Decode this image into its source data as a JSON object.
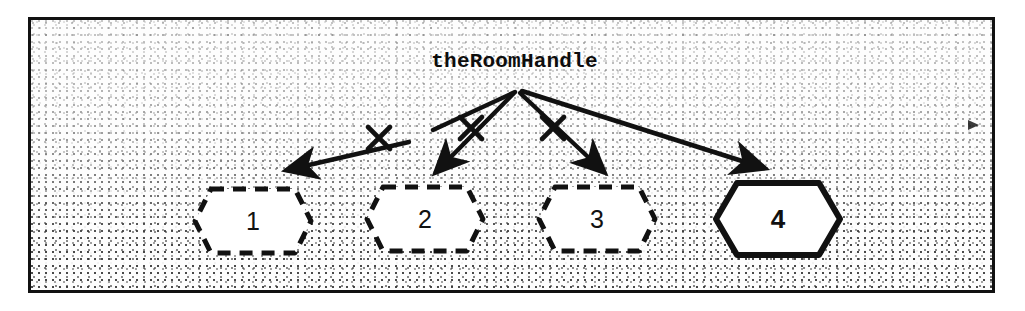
{
  "figure": {
    "title": "theRoomHandle",
    "frame": {
      "border_color": "#111111",
      "background_color": "#fdfdfd"
    }
  },
  "nodes": [
    {
      "id": "node-1",
      "label": "1",
      "state": "invalidated",
      "border_style": "dashed"
    },
    {
      "id": "node-2",
      "label": "2",
      "state": "invalidated",
      "border_style": "dashed"
    },
    {
      "id": "node-3",
      "label": "3",
      "state": "invalidated",
      "border_style": "dashed"
    },
    {
      "id": "node-4",
      "label": "4",
      "state": "current",
      "border_style": "solid"
    }
  ],
  "edges": [
    {
      "id": "edge-1",
      "target": "1",
      "line_style": "broken",
      "crossed_out": true,
      "mark": "x"
    },
    {
      "id": "edge-2",
      "target": "2",
      "line_style": "solid",
      "crossed_out": true,
      "mark": "x"
    },
    {
      "id": "edge-3",
      "target": "3",
      "line_style": "solid",
      "crossed_out": true,
      "mark": "x"
    },
    {
      "id": "edge-4",
      "target": "4",
      "line_style": "solid",
      "crossed_out": false,
      "mark": ""
    }
  ],
  "colors": {
    "ink": "#111111",
    "paper": "#ffffff",
    "node_fill": "#ffffff"
  }
}
